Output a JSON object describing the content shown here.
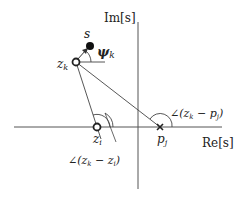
{
  "diagram": {
    "type": "complex-plane pole-zero angle diagram",
    "axes": {
      "imag_label": "Im[s]",
      "real_label": "Re[s]"
    },
    "points": {
      "s": {
        "label": "s",
        "marker": "filled-dot"
      },
      "z_k": {
        "label": "z",
        "sub": "k",
        "marker": "open-circle"
      },
      "z_i": {
        "label": "z",
        "sub": "i",
        "marker": "open-circle"
      },
      "p_j": {
        "label": "p",
        "sub": "j",
        "marker": "cross"
      }
    },
    "angles": {
      "psi_k": {
        "label": "ψ",
        "sub": "k"
      },
      "zk_minus_zi": {
        "text": "∠(z",
        "sub1": "k",
        "mid": " − z",
        "sub2": "i",
        "end": ")"
      },
      "zk_minus_pj": {
        "text": "∠(z",
        "sub1": "k",
        "mid": " − p",
        "sub2": "j",
        "end": ")"
      }
    },
    "colors": {
      "line": "#444444",
      "axis": "#555555",
      "text": "#222222"
    }
  }
}
